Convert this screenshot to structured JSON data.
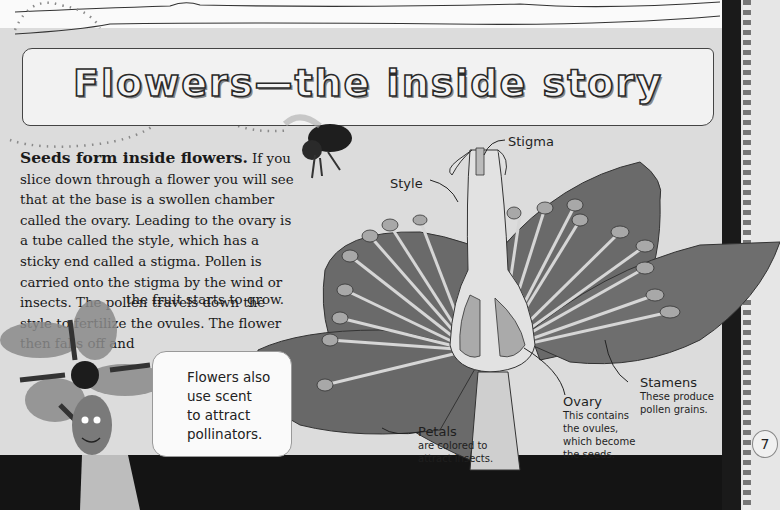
{
  "page": {
    "title": "Flowers—the inside story",
    "page_number": "7",
    "colors": {
      "background": "#dcdcdc",
      "petal": "#6a6a6a",
      "stamen": "#d6d6d6",
      "anther": "#a8a8a8",
      "ground": "#141414"
    }
  },
  "body": {
    "lead": "Seeds form inside flowers.",
    "paragraph": " If you slice down through a flower you will see that at the base is a swollen chamber called the ovary. Leading to the ovary is a tube called the style, which has a sticky end called a stigma. Pollen is carried onto the stigma by the wind or insects. The pollen travels down the style to fertilize the ovules. The flower then falls off and",
    "last_line": "the fruit starts to grow."
  },
  "bubble": {
    "text": "Flowers also use scent to attract pollinators.",
    "lines": [
      "Flowers also",
      "use scent",
      "to attract",
      "pollinators."
    ]
  },
  "diagram": {
    "labels": {
      "stigma": {
        "title": "Stigma"
      },
      "style": {
        "title": "Style"
      },
      "petals": {
        "title": "Petals",
        "lines": [
          "are colored to",
          "attract insects."
        ]
      },
      "ovary": {
        "title": "Ovary",
        "lines": [
          "This contains",
          "the ovules,",
          "which become",
          "the seeds."
        ]
      },
      "stamens": {
        "title": "Stamens",
        "lines": [
          "These produce",
          "pollen grains."
        ]
      }
    }
  },
  "illustrations": {
    "bee": "bumblebee-photo",
    "character": "flower-head-character"
  }
}
